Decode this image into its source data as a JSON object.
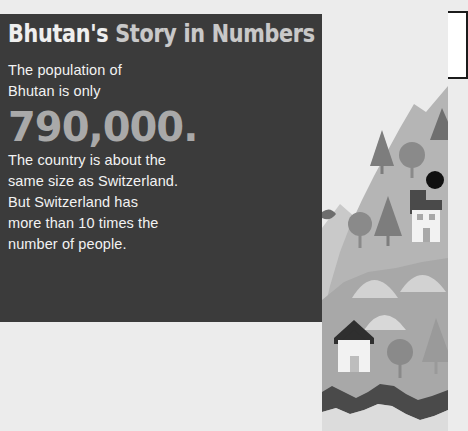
{
  "page": {
    "background_color": "#ececec",
    "width": 448,
    "height": 431
  },
  "panel": {
    "background_color": "#3b3b3b",
    "title_part_1": "Bhutan's",
    "title_part_2": " Story in Numbers",
    "title_full": "Bhutan's Story in Numbers",
    "title_color": "#efefef",
    "body": {
      "line_1": "The population of",
      "line_2": "Bhutan is only",
      "big_number": "790,000.",
      "big_number_color": "#a9a9a9",
      "line_3": "The country is about the",
      "line_4": "same size as Switzerland.",
      "line_5": "But Switzerland has",
      "line_6": "more than 10 times the",
      "line_7": "number of people."
    }
  },
  "callout": {
    "border_color": "#1b1b1b",
    "background_color": "#ffffff",
    "line_1": "The H",
    "line_2": "is an",
    "line_3": "north"
  },
  "illustration": {
    "name": "bhutan-landscape",
    "sky_color": "#ececec",
    "mountain_far_color": "#c9c9c9",
    "mountain_mid_color": "#b5b5b5",
    "ground_color": "#a8a8a8",
    "tree_color": "#7d7d7d",
    "house_wall_color": "#f2f2f2",
    "house_roof_color": "#4a4a4a",
    "river_color": "#4a4a4a",
    "marker_color": "#111111",
    "hill_light_color": "#d2d2d2"
  }
}
